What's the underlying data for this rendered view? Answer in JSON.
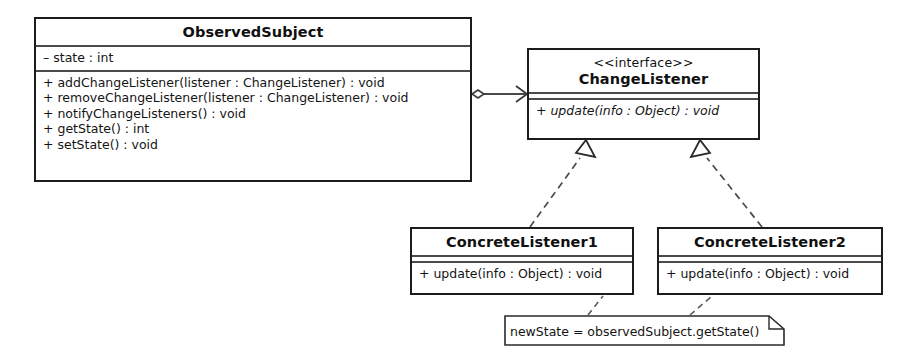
{
  "diagram": {
    "stroke_color": "#1c1c1c",
    "separator_color": "#4a4a4a",
    "background_color": "#ffffff"
  },
  "classes": [
    {
      "id": "observed-subject",
      "name": "ObservedSubject",
      "stereotype": "",
      "attributes": [
        "– state : int"
      ],
      "operations": [
        "+ addChangeListener(listener : ChangeListener) : void",
        "+ removeChangeListener(listener : ChangeListener) : void",
        "+ notifyChangeListeners() : void",
        "+ getState() : int",
        "+ setState() : void"
      ]
    },
    {
      "id": "change-listener",
      "name": "ChangeListener",
      "stereotype": "<<interface>>",
      "attributes": [],
      "operations": [
        "+ update(info : Object) : void"
      ]
    },
    {
      "id": "concrete-listener-1",
      "name": "ConcreteListener1",
      "stereotype": "",
      "attributes": [],
      "operations": [
        "+ update(info : Object) : void"
      ]
    },
    {
      "id": "concrete-listener-2",
      "name": "ConcreteListener2",
      "stereotype": "",
      "attributes": [],
      "operations": [
        "+ update(info : Object) : void"
      ]
    }
  ],
  "note": {
    "id": "note-new-state",
    "text": "newState = observedSubject.getState()"
  },
  "relationships": [
    {
      "id": "aggregation-subject-listener",
      "type": "aggregation",
      "source": "ObservedSubject",
      "target": "ChangeListener",
      "source_decoration": "hollow-diamond",
      "target_decoration": "open-arrow",
      "line_style": "solid"
    },
    {
      "id": "realization-listener1",
      "type": "realization",
      "source": "ConcreteListener1",
      "target": "ChangeListener",
      "source_decoration": "none",
      "target_decoration": "hollow-triangle",
      "line_style": "dashed"
    },
    {
      "id": "realization-listener2",
      "type": "realization",
      "source": "ConcreteListener2",
      "target": "ChangeListener",
      "source_decoration": "none",
      "target_decoration": "hollow-triangle",
      "line_style": "dashed"
    },
    {
      "id": "note-anchor-listener1",
      "type": "note-anchor",
      "source": "note-new-state",
      "target": "ConcreteListener1",
      "source_decoration": "none",
      "target_decoration": "none",
      "line_style": "dashed"
    },
    {
      "id": "note-anchor-listener2",
      "type": "note-anchor",
      "source": "note-new-state",
      "target": "ConcreteListener2",
      "source_decoration": "none",
      "target_decoration": "none",
      "line_style": "dashed"
    }
  ]
}
